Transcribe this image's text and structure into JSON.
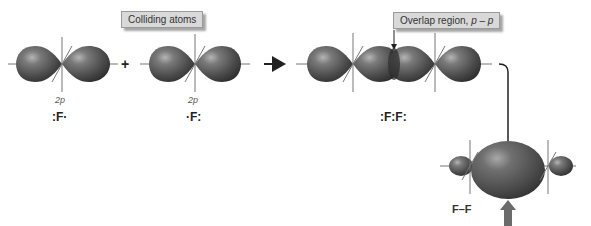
{
  "labels": {
    "colliding_atoms": "Colliding atoms",
    "overlap_region_prefix": "Overlap region, ",
    "overlap_region_math": "p – p"
  },
  "atoms": [
    {
      "orbital": "2p",
      "lewis": ":F·"
    },
    {
      "orbital": "2p",
      "lewis": "·F:"
    }
  ],
  "molecule_lewis": ":F:F:",
  "product_label": "F–F",
  "operators": {
    "plus": "+"
  },
  "colors": {
    "lobe_dark": "#3a3a3a",
    "lobe_mid": "#6a6a6a",
    "lobe_highlight": "#b0b0b0",
    "label_bg": "#d9d9d9",
    "axis": "#777777",
    "gray_arrow": "#6b6b6b"
  }
}
